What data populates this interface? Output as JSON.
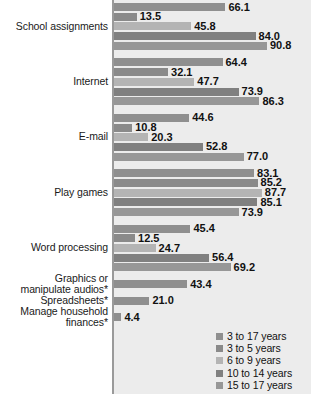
{
  "chart_data": {
    "type": "bar",
    "orientation": "horizontal",
    "title": "",
    "subtitle": "",
    "xlabel": "",
    "ylabel": "",
    "xlim": [
      0,
      100
    ],
    "grid": false,
    "legend_position": "bottom-right",
    "categories": [
      "School assignments",
      "Internet",
      "E-mail",
      "Play games",
      "Word processing",
      "Graphics or\nmanipulate audios*",
      "Spreadsheets*",
      "Manage household\nfinances*"
    ],
    "series": [
      {
        "name": "3 to 17 years",
        "color": "#8f8f8f",
        "values": [
          66.1,
          64.4,
          44.6,
          83.1,
          45.4,
          43.4,
          21.0,
          4.4
        ]
      },
      {
        "name": "3 to 5 years",
        "color": "#8a8a8a",
        "values": [
          13.5,
          32.1,
          10.8,
          85.2,
          12.5,
          null,
          null,
          null
        ]
      },
      {
        "name": "6 to 9 years",
        "color": "#b4b4b4",
        "values": [
          45.8,
          47.7,
          20.3,
          87.7,
          24.7,
          null,
          null,
          null
        ]
      },
      {
        "name": "10 to 14 years",
        "color": "#808080",
        "values": [
          84.0,
          73.9,
          52.8,
          85.1,
          56.4,
          null,
          null,
          null
        ]
      },
      {
        "name": "15 to 17 years",
        "color": "#979797",
        "values": [
          90.8,
          86.3,
          77.0,
          73.9,
          69.2,
          null,
          null,
          null
        ]
      }
    ],
    "legend": [
      "3 to 17 years",
      "3 to 5 years",
      "6 to 9 years",
      "10 to 14 years",
      "15 to 17 years"
    ],
    "data_labels": [
      "66.1",
      "13.5",
      "45.8",
      "84.0",
      "90.8",
      "64.4",
      "32.1",
      "47.7",
      "73.9",
      "86.3",
      "44.6",
      "10.8",
      "20.3",
      "52.8",
      "77.0",
      "83.1",
      "85.2",
      "87.7",
      "85.1",
      "73.9",
      "45.4",
      "12.5",
      "24.7",
      "56.4",
      "69.2",
      "43.4",
      "21.0",
      "4.4"
    ]
  },
  "colors": {
    "plot_background": "#ececec",
    "page_background": "#ffffff",
    "axis": "#9a9a9a",
    "label_text": "#1a1a1a",
    "value_text": "#111111"
  }
}
